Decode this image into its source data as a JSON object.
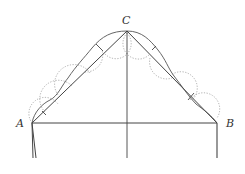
{
  "diagram": {
    "labels": {
      "A": "A",
      "B": "B",
      "C": "C"
    },
    "points": {
      "A": [
        32,
        123
      ],
      "B": [
        217,
        123
      ],
      "C": [
        127,
        31
      ]
    },
    "colors": {
      "line": "#444444",
      "curve": "#666666",
      "dotted": "#999999"
    }
  }
}
